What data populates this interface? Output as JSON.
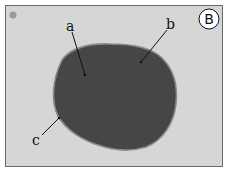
{
  "figure": {
    "panel_label": "B",
    "labels": [
      {
        "id": "a",
        "text": "a"
      },
      {
        "id": "b",
        "text": "b"
      },
      {
        "id": "c",
        "text": "c"
      }
    ],
    "colors": {
      "background": "#d6d6d6",
      "blob": "#464646",
      "blob_edge": "#8a8a8a",
      "frame": "#6a6a6a",
      "dot": "#9a9a9a"
    }
  }
}
